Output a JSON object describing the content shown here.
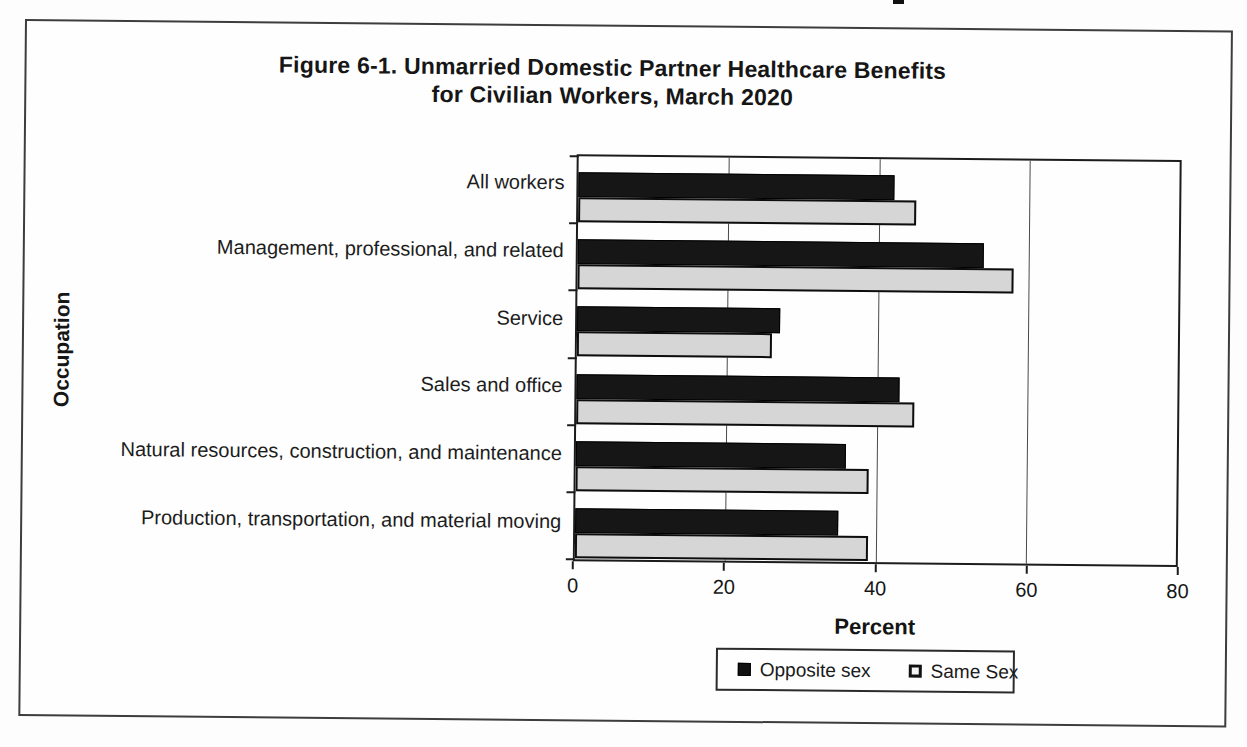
{
  "figure": {
    "title_line1": "Figure 6-1. Unmarried Domestic Partner Healthcare Benefits",
    "title_line2": "for Civilian Workers, March 2020"
  },
  "chart_data": {
    "type": "bar",
    "orientation": "horizontal",
    "title": "Figure 6-1. Unmarried Domestic Partner Healthcare Benefits for Civilian Workers, March 2020",
    "xlabel": "Percent",
    "ylabel": "Occupation",
    "xlim": [
      0,
      80
    ],
    "xticks": [
      0,
      20,
      40,
      60,
      80
    ],
    "grid": "vertical gridlines at each x tick",
    "legend_position": "boxed, bottom center",
    "categories": [
      "All workers",
      "Management, professional, and related",
      "Service",
      "Sales and office",
      "Natural resources, construction, and maintenance",
      "Production, transportation, and material moving"
    ],
    "series": [
      {
        "name": "Opposite sex",
        "color": "#161616",
        "values": [
          42,
          54,
          27,
          43,
          36,
          35
        ]
      },
      {
        "name": "Same Sex",
        "color": "#d6d6d6",
        "values": [
          45,
          58,
          26,
          45,
          39,
          39
        ]
      }
    ]
  }
}
